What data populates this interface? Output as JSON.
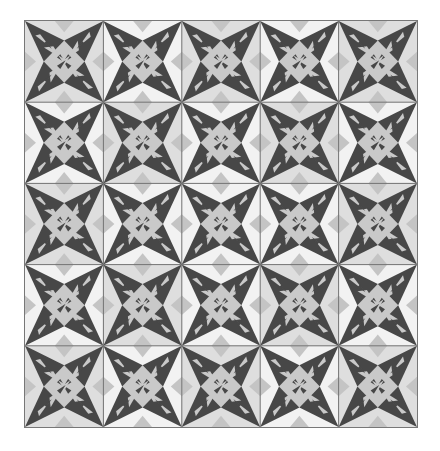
{
  "quilt": {
    "title": "Star quilt pattern",
    "rows": 5,
    "cols": 5,
    "colors": {
      "background": "#dedede",
      "light_kite": "#f2f2f2",
      "mid_kite": "#cfcfcf",
      "edge_diamond": "#c4c4c4",
      "center_diamond": "#c9c9c9",
      "dark": "#474747",
      "seam": "#6e6e6e"
    },
    "light_pattern": [
      [
        0,
        1,
        0,
        1,
        0
      ],
      [
        1,
        0,
        1,
        0,
        1
      ],
      [
        0,
        1,
        1,
        1,
        0
      ],
      [
        1,
        0,
        1,
        0,
        1
      ],
      [
        0,
        1,
        0,
        1,
        0
      ]
    ]
  }
}
